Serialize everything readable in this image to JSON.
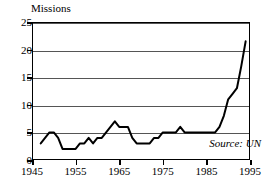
{
  "chart_data": {
    "type": "line",
    "title": "Missions",
    "xlabel": "",
    "ylabel": "Missions",
    "xlim": [
      1945,
      1995
    ],
    "ylim": [
      0,
      25
    ],
    "grid": true,
    "legend": "none",
    "annotations": [
      {
        "name": "source-note",
        "text": "Source: UN"
      }
    ],
    "yticks": [
      0,
      5,
      10,
      15,
      20,
      25
    ],
    "ytick_labels": [
      "0",
      "5",
      "10",
      "15",
      "20",
      "25"
    ],
    "xticks": [
      1945,
      1955,
      1965,
      1975,
      1985,
      1995
    ],
    "xtick_labels": [
      "1945",
      "1955",
      "1965",
      "1975",
      "1985",
      "1995"
    ],
    "series": [
      {
        "name": "UN missions",
        "color": "#000000",
        "x": [
          1947,
          1948,
          1949,
          1950,
          1951,
          1952,
          1953,
          1954,
          1955,
          1956,
          1957,
          1958,
          1959,
          1960,
          1961,
          1962,
          1963,
          1964,
          1965,
          1966,
          1967,
          1968,
          1969,
          1970,
          1971,
          1972,
          1973,
          1974,
          1975,
          1976,
          1977,
          1978,
          1979,
          1980,
          1981,
          1982,
          1983,
          1984,
          1985,
          1986,
          1987,
          1988,
          1989,
          1990,
          1991,
          1992,
          1993,
          1994
        ],
        "values": [
          3,
          4,
          5,
          5,
          4,
          2,
          2,
          2,
          2,
          3,
          3,
          4,
          3,
          4,
          4,
          5,
          6,
          7,
          6,
          6,
          6,
          4,
          3,
          3,
          3,
          3,
          4,
          4,
          5,
          5,
          5,
          5,
          6,
          5,
          5,
          5,
          5,
          5,
          5,
          5,
          5,
          6,
          8,
          11,
          12,
          13,
          17,
          21.5
        ]
      }
    ]
  }
}
